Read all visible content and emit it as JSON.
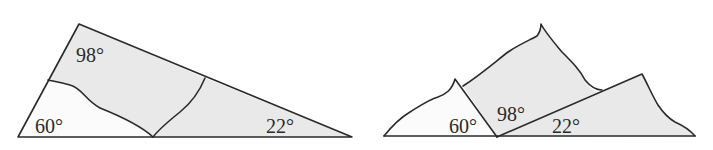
{
  "left_figure": {
    "description": "Triangle cut into three torn pieces",
    "angles": [
      {
        "label": "98°",
        "position": "top vertex"
      },
      {
        "label": "60°",
        "position": "bottom-left vertex"
      },
      {
        "label": "22°",
        "position": "bottom-right vertex"
      }
    ]
  },
  "right_figure": {
    "description": "Three torn corners rearranged along a straight line",
    "angles": [
      {
        "label": "60°",
        "position": "left"
      },
      {
        "label": "98°",
        "position": "middle"
      },
      {
        "label": "22°",
        "position": "right"
      }
    ]
  },
  "colors": {
    "line": "#2a2a2a",
    "shaded_fill": "#e9e9e9",
    "white_fill": "#fbfbfb"
  }
}
